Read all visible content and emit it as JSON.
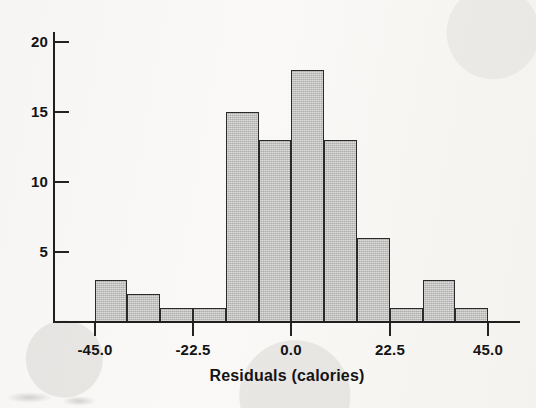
{
  "chart_data": {
    "type": "bar",
    "title": "",
    "xlabel": "Residuals (calories)",
    "ylabel": "",
    "grid": false,
    "legend": null,
    "xlim": [
      -56.0,
      56.0
    ],
    "ylim": [
      0,
      21.0
    ],
    "xticks": [
      "-45.0",
      "-22.5",
      "0.0",
      "22.5",
      "45.0"
    ],
    "xtick_values": [
      -45.0,
      -22.5,
      0.0,
      22.5,
      45.0
    ],
    "yticks": [
      "5",
      "10",
      "15",
      "20"
    ],
    "ytick_values": [
      5,
      10,
      15,
      20
    ],
    "bin_width": 7.5,
    "bin_edges": [
      -45.0,
      -37.5,
      -30.0,
      -22.5,
      -15.0,
      -7.5,
      0.0,
      7.5,
      15.0,
      22.5,
      30.0,
      37.5,
      45.0
    ],
    "categories": [
      "-45.0 to -37.5",
      "-37.5 to -30.0",
      "-30.0 to -22.5",
      "-22.5 to -15.0",
      "-15.0 to -7.5",
      "-7.5 to 0.0",
      "0.0 to 7.5",
      "7.5 to 15.0",
      "15.0 to 22.5",
      "22.5 to 30.0",
      "30.0 to 37.5",
      "37.5 to 45.0"
    ],
    "values": [
      3,
      2,
      1,
      1,
      15,
      13,
      18,
      13,
      6,
      1,
      3,
      1
    ],
    "bar_fill_color": "#b9b9b7",
    "bar_edge_color": "#2a2a2a",
    "axis_color": "#1f1f1f",
    "background_color": "#f6f5f3"
  },
  "axis": {
    "x_title": "Residuals (calories)"
  }
}
